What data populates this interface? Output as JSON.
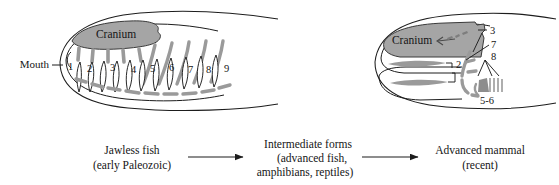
{
  "figure": {
    "title_present": false,
    "colors": {
      "outline": "#1d1d1d",
      "bone_gray": "#9a9a9a",
      "cranium_fill": "#a5a5a5",
      "cranium_stroke": "#3a3a3a",
      "text": "#151515",
      "background": "#ffffff"
    },
    "panels": [
      {
        "id": "jawless-fish-head",
        "side": "left",
        "labels": {
          "cranium": "Cranium",
          "mouth": "Mouth"
        },
        "gill_arch_numbers": [
          "1",
          "2",
          "3",
          "4",
          "5",
          "6",
          "7",
          "8",
          "9"
        ]
      },
      {
        "id": "advanced-mammal-head",
        "side": "right",
        "labels": {
          "cranium": "Cranium"
        },
        "callout_numbers": [
          "2",
          "3",
          "7",
          "8",
          "5-6"
        ]
      }
    ],
    "flow": {
      "steps": [
        {
          "id": "step-jawless-fish",
          "lines": [
            "Jawless fish",
            "(early Paleozoic)"
          ]
        },
        {
          "id": "step-intermediate-forms",
          "lines": [
            "Intermediate forms",
            "(advanced fish,",
            "amphibians, reptiles)"
          ]
        },
        {
          "id": "step-advanced-mammal",
          "lines": [
            "Advanced mammal",
            "(recent)"
          ]
        }
      ],
      "arrows": [
        "arrow-1",
        "arrow-2"
      ]
    }
  }
}
